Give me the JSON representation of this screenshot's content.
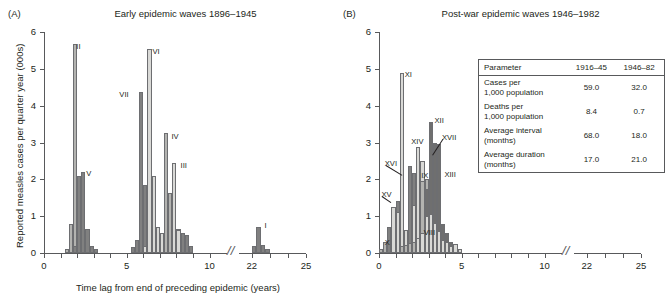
{
  "figure": {
    "xlabel": "Time lag from end of preceding epidemic (years)",
    "ylabel": "Reported measles cases per quarter year (000s)",
    "xticks": [
      "0",
      "5",
      "10",
      "22",
      "25"
    ],
    "yticks": [
      "0",
      "1",
      "2",
      "3",
      "4",
      "5",
      "6"
    ],
    "axis_break_glyph": "//",
    "colors": {
      "light": "#d9d9d6",
      "mid": "#b3b3b0",
      "dark": "#808080",
      "darker": "#6f6f6f",
      "axis": "#58595b",
      "text": "#231f20",
      "outline": "#6d6e71"
    }
  },
  "panels": [
    {
      "tag": "(A)",
      "title": "Early epidemic waves 1896–1945"
    },
    {
      "tag": "(B)",
      "title": "Post-war epidemic waves 1946–1982"
    }
  ],
  "inset_table": {
    "headers": [
      "Parameter",
      "1916–45",
      "1946–82"
    ],
    "rows": [
      {
        "param_line1": "Cases per",
        "param_line2": "1,000 population",
        "v1": "59.0",
        "v2": "32.0"
      },
      {
        "param_line1": "Deaths per",
        "param_line2": "1,000 population",
        "v1": "8.4",
        "v2": "0.7"
      },
      {
        "param_line1": "Average interval",
        "param_line2": "(months)",
        "v1": "68.0",
        "v2": "18.0"
      },
      {
        "param_line1": "Average duration",
        "param_line2": "(months)",
        "v1": "17.0",
        "v2": "21.0"
      }
    ]
  },
  "chart_data": [
    {
      "type": "bar",
      "panel": "A",
      "title": "Early epidemic waves 1896–1945",
      "xlabel": "Time lag from end of preceding epidemic (years)",
      "ylabel": "Reported measles cases per quarter year (000s)",
      "xlim": [
        0,
        25
      ],
      "ylim": [
        0,
        6
      ],
      "xticks": [
        0,
        5,
        10,
        22,
        25
      ],
      "yticks": [
        0,
        1,
        2,
        3,
        4,
        5,
        6
      ],
      "grid": false,
      "legend": "none",
      "axis_break": {
        "from": 10.7,
        "to": 21.3
      },
      "bin_width": 0.25,
      "note": "Overlaid histograms of successive epidemic waves; each wave labelled with a Roman numeral.",
      "series": [
        {
          "name": "II",
          "shade": "mid",
          "label": "II",
          "bars": [
            {
              "x": 1.25,
              "y": 0.1
            },
            {
              "x": 1.5,
              "y": 0.8
            },
            {
              "x": 1.75,
              "y": 5.68
            },
            {
              "x": 2.0,
              "y": 0.85
            },
            {
              "x": 2.25,
              "y": 0.3
            },
            {
              "x": 2.5,
              "y": 0.12
            }
          ]
        },
        {
          "name": "V",
          "shade": "dark",
          "label": "V",
          "bars": [
            {
              "x": 1.75,
              "y": 0.2
            },
            {
              "x": 2.0,
              "y": 2.1
            },
            {
              "x": 2.25,
              "y": 2.2
            },
            {
              "x": 2.5,
              "y": 0.65
            },
            {
              "x": 2.75,
              "y": 0.2
            },
            {
              "x": 3.0,
              "y": 0.1
            }
          ]
        },
        {
          "name": "VII",
          "shade": "dark",
          "label": "VII",
          "bars": [
            {
              "x": 5.25,
              "y": 0.15
            },
            {
              "x": 5.5,
              "y": 0.35
            },
            {
              "x": 5.75,
              "y": 4.36
            },
            {
              "x": 6.0,
              "y": 1.85
            },
            {
              "x": 6.25,
              "y": 0.15
            }
          ]
        },
        {
          "name": "VI",
          "shade": "light",
          "label": "VI",
          "bars": [
            {
              "x": 6.0,
              "y": 0.2
            },
            {
              "x": 6.25,
              "y": 5.55
            },
            {
              "x": 6.5,
              "y": 2.08
            },
            {
              "x": 6.75,
              "y": 0.7
            },
            {
              "x": 7.0,
              "y": 0.55
            },
            {
              "x": 7.25,
              "y": 0.6
            }
          ]
        },
        {
          "name": "IV",
          "shade": "mid",
          "label": "IV",
          "bars": [
            {
              "x": 7.25,
              "y": 3.25
            },
            {
              "x": 7.5,
              "y": 1.62
            },
            {
              "x": 7.75,
              "y": 0.6
            },
            {
              "x": 8.0,
              "y": 0.65
            },
            {
              "x": 8.25,
              "y": 0.4
            }
          ]
        },
        {
          "name": "III",
          "shade": "light",
          "label": "III",
          "bars": [
            {
              "x": 7.75,
              "y": 2.45
            },
            {
              "x": 8.0,
              "y": 0.62
            },
            {
              "x": 8.25,
              "y": 0.4
            },
            {
              "x": 8.5,
              "y": 0.2
            }
          ]
        },
        {
          "name": "VIII-tail",
          "shade": "dark",
          "label": "",
          "bars": [
            {
              "x": 8.25,
              "y": 0.55
            },
            {
              "x": 8.5,
              "y": 0.5
            },
            {
              "x": 8.75,
              "y": 0.18
            }
          ]
        },
        {
          "name": "I",
          "shade": "dark",
          "label": "I",
          "bars": [
            {
              "x": 22.0,
              "y": 0.18
            },
            {
              "x": 22.25,
              "y": 0.7
            },
            {
              "x": 22.5,
              "y": 0.22
            },
            {
              "x": 22.75,
              "y": 0.12
            }
          ]
        }
      ]
    },
    {
      "type": "bar",
      "panel": "B",
      "title": "Post-war epidemic waves 1946–1982",
      "xlabel": "Time lag from end of preceding epidemic (years)",
      "ylabel": "Reported measles cases per quarter year (000s)",
      "xlim": [
        0,
        25
      ],
      "ylim": [
        0,
        6
      ],
      "xticks": [
        0,
        5,
        10,
        22,
        25
      ],
      "yticks": [
        0,
        1,
        2,
        3,
        4,
        5,
        6
      ],
      "grid": false,
      "legend": "none",
      "axis_break": {
        "from": 10.7,
        "to": 21.3
      },
      "bin_width": 0.25,
      "note": "Overlaid histograms of successive post-war epidemic waves; each wave labelled with a Roman numeral.",
      "series": [
        {
          "name": "X",
          "shade": "mid",
          "label": "X",
          "bars": [
            {
              "x": 0.0,
              "y": 0.1
            },
            {
              "x": 0.25,
              "y": 0.3
            },
            {
              "x": 0.5,
              "y": 0.32
            },
            {
              "x": 0.75,
              "y": 0.12
            },
            {
              "x": 1.0,
              "y": 0.08
            }
          ]
        },
        {
          "name": "XV",
          "shade": "dark",
          "label": "XV",
          "bars": [
            {
              "x": 0.5,
              "y": 0.7
            },
            {
              "x": 0.75,
              "y": 1.12
            },
            {
              "x": 1.0,
              "y": 1.42
            },
            {
              "x": 1.25,
              "y": 0.3
            },
            {
              "x": 1.5,
              "y": 0.15
            }
          ]
        },
        {
          "name": "XI",
          "shade": "light",
          "label": "XI",
          "bars": [
            {
              "x": 0.75,
              "y": 1.25
            },
            {
              "x": 1.0,
              "y": 1.1
            },
            {
              "x": 1.25,
              "y": 4.88
            },
            {
              "x": 1.5,
              "y": 0.62
            },
            {
              "x": 1.75,
              "y": 0.3
            },
            {
              "x": 2.0,
              "y": 0.25
            }
          ]
        },
        {
          "name": "XVI",
          "shade": "dark",
          "label": "XVI",
          "bars": [
            {
              "x": 1.75,
              "y": 2.35
            },
            {
              "x": 2.0,
              "y": 2.18
            },
            {
              "x": 2.25,
              "y": 2.52
            },
            {
              "x": 2.5,
              "y": 0.7
            },
            {
              "x": 2.75,
              "y": 0.3
            }
          ]
        },
        {
          "name": "XIV",
          "shade": "light",
          "label": "XIV",
          "bars": [
            {
              "x": 2.0,
              "y": 1.3
            },
            {
              "x": 2.25,
              "y": 2.88
            },
            {
              "x": 2.5,
              "y": 2.5
            },
            {
              "x": 2.75,
              "y": 1.95
            },
            {
              "x": 3.0,
              "y": 1.02
            },
            {
              "x": 3.25,
              "y": 0.7
            }
          ]
        },
        {
          "name": "IX",
          "shade": "mid",
          "label": "IX",
          "bars": [
            {
              "x": 2.5,
              "y": 1.95
            },
            {
              "x": 2.75,
              "y": 2.0
            },
            {
              "x": 3.0,
              "y": 1.1
            },
            {
              "x": 3.25,
              "y": 0.85
            },
            {
              "x": 3.5,
              "y": 0.55
            }
          ]
        },
        {
          "name": "XII",
          "shade": "darker",
          "label": "XII",
          "bars": [
            {
              "x": 2.75,
              "y": 1.75
            },
            {
              "x": 3.0,
              "y": 3.55
            },
            {
              "x": 3.25,
              "y": 2.78
            },
            {
              "x": 3.5,
              "y": 0.8
            },
            {
              "x": 3.75,
              "y": 0.45
            }
          ]
        },
        {
          "name": "XVII",
          "shade": "darker",
          "label": "XVII",
          "bars": [
            {
              "x": 3.25,
              "y": 3.0
            },
            {
              "x": 3.5,
              "y": 2.95
            }
          ]
        },
        {
          "name": "XIII",
          "shade": "darker",
          "label": "XIII",
          "bars": [
            {
              "x": 3.5,
              "y": 2.8
            },
            {
              "x": 3.75,
              "y": 0.8
            },
            {
              "x": 4.0,
              "y": 0.55
            },
            {
              "x": 4.25,
              "y": 0.3
            }
          ]
        },
        {
          "name": "VIII",
          "shade": "light",
          "label": "VIII",
          "bars": [
            {
              "x": 2.25,
              "y": 0.42
            },
            {
              "x": 2.5,
              "y": 0.55
            },
            {
              "x": 2.75,
              "y": 1.0
            },
            {
              "x": 3.0,
              "y": 1.05
            },
            {
              "x": 3.25,
              "y": 0.82
            },
            {
              "x": 3.5,
              "y": 0.6
            },
            {
              "x": 3.75,
              "y": 0.35
            },
            {
              "x": 4.0,
              "y": 0.3
            },
            {
              "x": 4.25,
              "y": 0.18
            },
            {
              "x": 4.5,
              "y": 0.25
            },
            {
              "x": 4.75,
              "y": 0.12
            }
          ]
        },
        {
          "name": "lowtail",
          "shade": "mid",
          "label": "",
          "bars": [
            {
              "x": 1.25,
              "y": 0.18
            },
            {
              "x": 1.5,
              "y": 0.22
            },
            {
              "x": 1.75,
              "y": 0.28
            },
            {
              "x": 2.0,
              "y": 0.3
            }
          ]
        }
      ]
    }
  ],
  "bar_labels": {
    "A": [
      {
        "text": "II",
        "x": 1.95,
        "y": 5.6,
        "leader": null
      },
      {
        "text": "V",
        "x": 2.55,
        "y": 2.15,
        "leader": null
      },
      {
        "text": "VII",
        "x": 4.55,
        "y": 4.3,
        "leader": null
      },
      {
        "text": "VI",
        "x": 6.55,
        "y": 5.45,
        "leader": null
      },
      {
        "text": "IV",
        "x": 7.7,
        "y": 3.15,
        "leader": null
      },
      {
        "text": "III",
        "x": 8.25,
        "y": 2.35,
        "leader": null
      },
      {
        "text": "I",
        "x": 22.7,
        "y": 0.72,
        "leader": null
      }
    ],
    "B": [
      {
        "text": "XI",
        "x": 1.55,
        "y": 4.82,
        "leader": null
      },
      {
        "text": "XII",
        "x": 3.35,
        "y": 3.58,
        "leader": null
      },
      {
        "text": "XVII",
        "x": 3.8,
        "y": 3.12,
        "leader": {
          "dx": -0.55,
          "dy": -0.45
        }
      },
      {
        "text": "XIV",
        "x": 1.95,
        "y": 3.02,
        "leader": null
      },
      {
        "text": "XVI",
        "x": 0.35,
        "y": 2.42,
        "leader": {
          "dx": 1.05,
          "dy": -0.3
        }
      },
      {
        "text": "XIII",
        "x": 3.95,
        "y": 2.12,
        "leader": null
      },
      {
        "text": "IX",
        "x": 2.55,
        "y": 2.1,
        "leader": null
      },
      {
        "text": "XV",
        "x": 0.15,
        "y": 1.58,
        "leader": {
          "dx": 0.62,
          "dy": -0.2
        }
      },
      {
        "text": "VIII",
        "x": 2.7,
        "y": 0.55,
        "leader": null
      },
      {
        "text": "X",
        "x": 0.35,
        "y": 0.28,
        "leader": null
      }
    ]
  }
}
